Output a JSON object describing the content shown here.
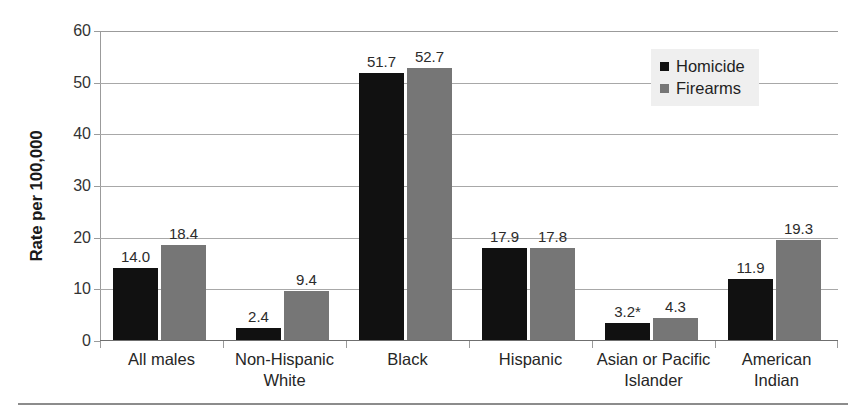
{
  "chart_data": {
    "type": "bar",
    "title": "",
    "xlabel": "",
    "ylabel": "Rate per 100,000",
    "ylim": [
      0,
      60
    ],
    "yticks": [
      0,
      10,
      20,
      30,
      40,
      50,
      60
    ],
    "grid": true,
    "legend_position": "top-right",
    "categories": [
      "All males",
      "Non-Hispanic White",
      "Black",
      "Hispanic",
      "Asian or Pacific Islander",
      "American Indian"
    ],
    "category_lines": [
      [
        "All males"
      ],
      [
        "Non-Hispanic",
        "White"
      ],
      [
        "Black"
      ],
      [
        "Hispanic"
      ],
      [
        "Asian or Pacific",
        "Islander"
      ],
      [
        "American",
        "Indian"
      ]
    ],
    "series": [
      {
        "name": "Homicide",
        "color": "#111111",
        "values": [
          14.0,
          2.4,
          51.7,
          17.9,
          3.2,
          11.9
        ],
        "labels": [
          "14.0",
          "2.4",
          "51.7",
          "17.9",
          "3.2*",
          "11.9"
        ]
      },
      {
        "name": "Firearms",
        "color": "#767676",
        "values": [
          18.4,
          9.4,
          52.7,
          17.8,
          4.3,
          19.3
        ],
        "labels": [
          "18.4",
          "9.4",
          "52.7",
          "17.8",
          "4.3",
          "19.3"
        ]
      }
    ],
    "footnote_marker": "*"
  },
  "legend": {
    "items": [
      {
        "label": "Homicide",
        "color": "#111111"
      },
      {
        "label": "Firearms",
        "color": "#767676"
      }
    ]
  },
  "axis": {
    "y_title": "Rate per 100,000",
    "y_tick_labels": [
      "60",
      "50",
      "40",
      "30",
      "20",
      "10",
      "0"
    ]
  }
}
